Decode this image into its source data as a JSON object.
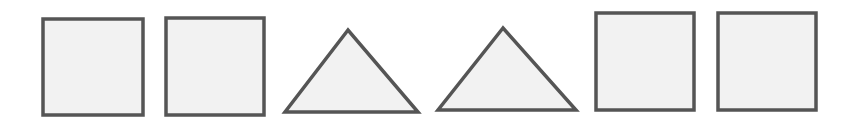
{
  "figure": {
    "width": 867,
    "height": 130,
    "background": "#ffffff",
    "stroke_color": "#555555",
    "fill_color": "#f2f2f2",
    "stroke_width": 3.5
  },
  "shapes": [
    {
      "type": "square",
      "x": 43,
      "y": 19,
      "w": 100,
      "h": 96
    },
    {
      "type": "square",
      "x": 166,
      "y": 18,
      "w": 98,
      "h": 97
    },
    {
      "type": "triangle",
      "points": [
        [
          348,
          30
        ],
        [
          285,
          112
        ],
        [
          418,
          112
        ]
      ]
    },
    {
      "type": "triangle",
      "points": [
        [
          503,
          28
        ],
        [
          438,
          110
        ],
        [
          576,
          110
        ]
      ]
    },
    {
      "type": "square",
      "x": 596,
      "y": 13,
      "w": 98,
      "h": 97
    },
    {
      "type": "square",
      "x": 718,
      "y": 13,
      "w": 98,
      "h": 97
    }
  ]
}
